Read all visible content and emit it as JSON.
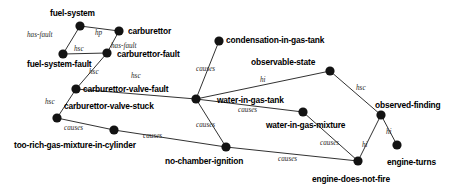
{
  "diagram": {
    "width": 465,
    "height": 188,
    "node_color": "#131313",
    "edge_color": "#1a1a1a",
    "background": "#ffffff",
    "nodes": [
      {
        "id": "fuel-system",
        "label": "fuel-system",
        "x": 80,
        "y": 26,
        "lx": 50,
        "ly": 9
      },
      {
        "id": "carburettor",
        "label": "carburettor",
        "x": 119,
        "y": 31,
        "lx": 128,
        "ly": 27
      },
      {
        "id": "fuel-system-fault",
        "label": "fuel-system-fault",
        "x": 63,
        "y": 54,
        "lx": 27,
        "ly": 60
      },
      {
        "id": "carburettor-fault",
        "label": "carburettor-fault",
        "x": 107,
        "y": 53,
        "lx": 117,
        "ly": 50
      },
      {
        "id": "carburettor-valve-fault",
        "label": "carburettor-valve-fault",
        "x": 76,
        "y": 89,
        "lx": 83,
        "ly": 85
      },
      {
        "id": "carburettor-valve-stuck",
        "label": "carburettor-valve-stuck",
        "x": 57,
        "y": 118,
        "lx": 64,
        "ly": 102
      },
      {
        "id": "too-rich-gas-mixture-in-cylinder",
        "label": "too-rich-gas-mixture-in-cylinder",
        "x": 114,
        "y": 130,
        "lx": 14,
        "ly": 141
      },
      {
        "id": "condensation-in-gas-tank",
        "label": "condensation-in-gas-tank",
        "x": 219,
        "y": 41,
        "lx": 226,
        "ly": 36
      },
      {
        "id": "observable-state",
        "label": "observable-state",
        "x": 330,
        "y": 71,
        "lx": 251,
        "ly": 58
      },
      {
        "id": "water-in-gas-tank",
        "label": "water-in-gas-tank",
        "x": 196,
        "y": 99,
        "lx": 217,
        "ly": 96
      },
      {
        "id": "water-in-gas-mixture",
        "label": "water-in-gas-mixture",
        "x": 303,
        "y": 112,
        "lx": 266,
        "ly": 121
      },
      {
        "id": "observed-finding",
        "label": "observed-finding",
        "x": 381,
        "y": 115,
        "lx": 375,
        "ly": 101
      },
      {
        "id": "engine-turns",
        "label": "engine-turns",
        "x": 397,
        "y": 145,
        "lx": 387,
        "ly": 158
      },
      {
        "id": "no-chamber-ignition",
        "label": "no-chamber-ignition",
        "x": 226,
        "y": 147,
        "lx": 165,
        "ly": 157
      },
      {
        "id": "engine-does-not-fire",
        "label": "engine-does-not-fire",
        "x": 358,
        "y": 161,
        "lx": 312,
        "ly": 175
      }
    ],
    "edges": [
      {
        "from": "fuel-system",
        "to": "fuel-system-fault",
        "label": "has-fault",
        "lx": 27,
        "ly": 32
      },
      {
        "from": "fuel-system",
        "to": "carburettor",
        "label": "hp",
        "lx": 95,
        "ly": 30
      },
      {
        "from": "fuel-system-fault",
        "to": "carburettor-fault",
        "label": "hsc",
        "lx": 74,
        "ly": 46
      },
      {
        "from": "carburettor",
        "to": "carburettor-fault",
        "label": "has-fault",
        "lx": 111,
        "ly": 43
      },
      {
        "from": "carburettor-fault",
        "to": "carburettor-valve-fault",
        "label": "hsc",
        "lx": 89,
        "ly": 69
      },
      {
        "from": "carburettor-valve-fault",
        "to": "carburettor-valve-stuck",
        "label": "hsc",
        "lx": 45,
        "ly": 99
      },
      {
        "from": "carburettor-valve-fault",
        "to": "water-in-gas-tank",
        "label": "hsc",
        "lx": 131,
        "ly": 73
      },
      {
        "from": "carburettor-valve-stuck",
        "to": "too-rich-gas-mixture-in-cylinder",
        "label": "causes",
        "lx": 64,
        "ly": 125
      },
      {
        "from": "condensation-in-gas-tank",
        "to": "water-in-gas-tank",
        "label": "causes",
        "lx": 196,
        "ly": 66
      },
      {
        "from": "water-in-gas-tank",
        "to": "observable-state",
        "label": "hi",
        "lx": 260,
        "ly": 77
      },
      {
        "from": "observable-state",
        "to": "observed-finding",
        "label": "hsc",
        "lx": 356,
        "ly": 85
      },
      {
        "from": "water-in-gas-tank",
        "to": "water-in-gas-mixture",
        "label": "causes",
        "lx": 238,
        "ly": 107
      },
      {
        "from": "water-in-gas-tank",
        "to": "no-chamber-ignition",
        "label": "causes",
        "lx": 196,
        "ly": 122
      },
      {
        "from": "too-rich-gas-mixture-in-cylinder",
        "to": "no-chamber-ignition",
        "label": "causes",
        "lx": 143,
        "ly": 133
      },
      {
        "from": "water-in-gas-mixture",
        "to": "engine-does-not-fire",
        "label": "causes",
        "lx": 320,
        "ly": 140
      },
      {
        "from": "no-chamber-ignition",
        "to": "engine-does-not-fire",
        "label": "causes",
        "lx": 278,
        "ly": 156
      },
      {
        "from": "observed-finding",
        "to": "engine-turns",
        "label": "hi",
        "lx": 386,
        "ly": 129
      },
      {
        "from": "observed-finding",
        "to": "engine-does-not-fire",
        "label": "hi",
        "lx": 362,
        "ly": 142
      }
    ]
  }
}
